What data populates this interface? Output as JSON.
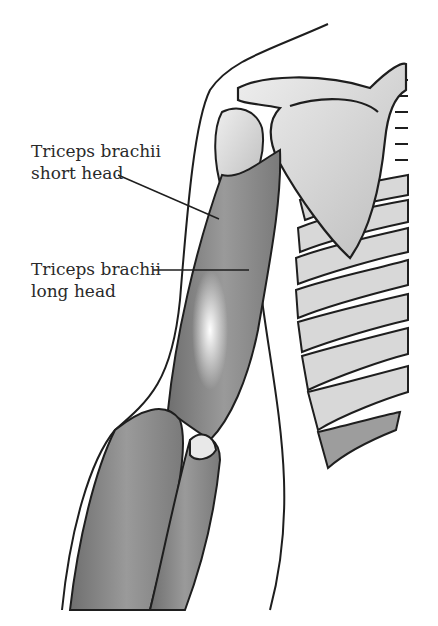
{
  "figure": {
    "colors": {
      "background": "#ffffff",
      "outline": "#1e1e1e",
      "muscle": "#8a8a8a",
      "bone": "#e2e2e2",
      "label_text": "#2a2a2a"
    }
  },
  "labels": [
    {
      "line1": "Triceps brachii",
      "line2": "short head"
    },
    {
      "line1": "Triceps brachii",
      "line2": "long head"
    }
  ]
}
